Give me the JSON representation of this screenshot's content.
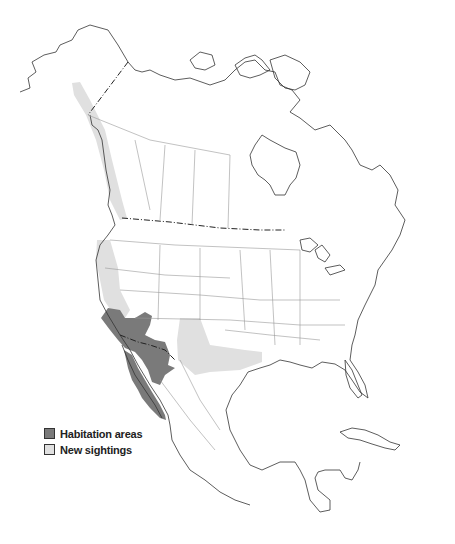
{
  "map": {
    "title": "",
    "region": "North America",
    "colors": {
      "habitation": "#7a7a7a",
      "sightings": "#e0e0e0",
      "outline": "#333333",
      "state_border": "#999999",
      "background": "#ffffff"
    }
  },
  "legend": {
    "items": [
      {
        "label": "Habitation areas",
        "color": "#7a7a7a"
      },
      {
        "label": "New sightings",
        "color": "#e0e0e0"
      }
    ]
  }
}
